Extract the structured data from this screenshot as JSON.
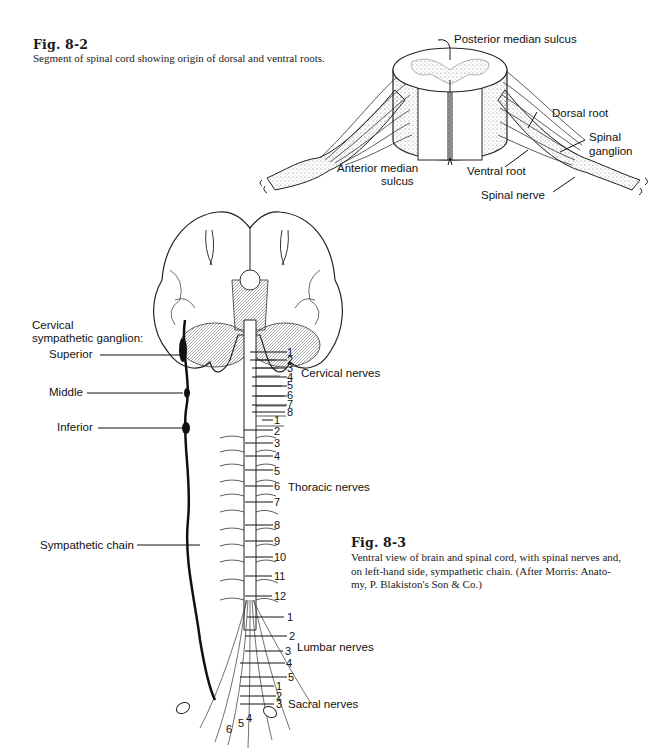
{
  "fig_8_2": {
    "title": "Fig. 8-2",
    "caption": "Segment of spinal cord showing origin of dorsal and ventral roots.",
    "labels": {
      "posterior_median_sulcus": "Posterior median sulcus",
      "dorsal_root": "Dorsal root",
      "spinal_ganglion_1": "Spinal",
      "spinal_ganglion_2": "ganglion",
      "anterior_median_sulcus_1": "Anterior median",
      "anterior_median_sulcus_2": "sulcus",
      "ventral_root": "Ventral root",
      "spinal_nerve": "Spinal nerve"
    }
  },
  "fig_8_3": {
    "title": "Fig. 8-3",
    "caption_lines": [
      "Ventral view of brain and spinal cord, with spinal nerves and,",
      "on left-hand side, sympathetic chain. (After Morris: Anato-",
      "my, P. Blakiston's Son & Co.)"
    ],
    "left_labels": {
      "cervical_ganglion_1": "Cervical",
      "cervical_ganglion_2": "sympathetic ganglion:",
      "superior": "Superior",
      "middle": "Middle",
      "inferior": "Inferior",
      "sympathetic_chain": "Sympathetic chain"
    },
    "groups": {
      "cervical": "Cervical nerves",
      "thoracic": "Thoracic nerves",
      "lumbar": "Lumbar nerves",
      "sacral": "Sacral nerves"
    },
    "cervical_numbers": [
      "1",
      "2",
      "3",
      "4",
      "5",
      "6",
      "7",
      "8"
    ],
    "thoracic_numbers": [
      "1",
      "2",
      "3",
      "4",
      "5",
      "6",
      "7",
      "8",
      "9",
      "10",
      "11",
      "12"
    ],
    "lumbar_numbers": [
      "1",
      "2",
      "3",
      "4",
      "5"
    ],
    "sacral_numbers": [
      "1",
      "2",
      "3",
      "4",
      "5",
      "6"
    ]
  }
}
